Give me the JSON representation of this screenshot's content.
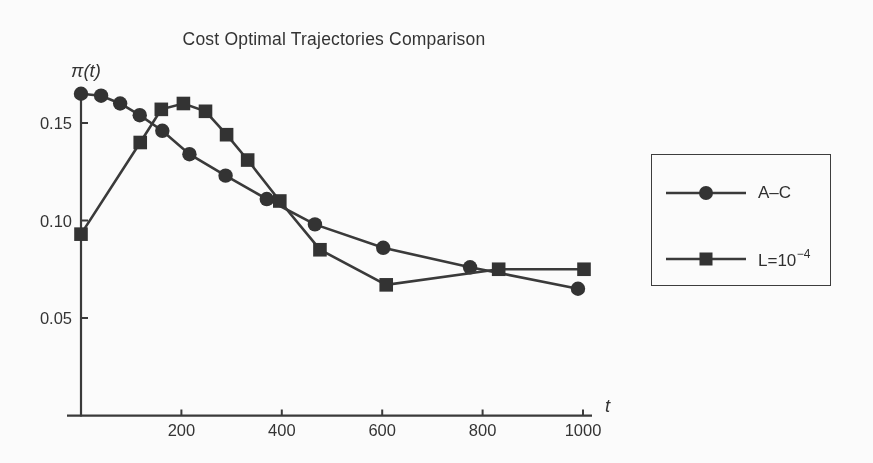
{
  "figure": {
    "background": "#fbfbfb",
    "ink": "#3a3a3a",
    "marker_fill": "#333333"
  },
  "chart_data": {
    "type": "line",
    "title": "Cost Optimal Trajectories Comparison",
    "xlabel": "t",
    "ylabel": "π(t)",
    "xlim": [
      0,
      1040
    ],
    "ylim": [
      0,
      0.17
    ],
    "grid": false,
    "legend_position": "outside-right",
    "x_ticks": [
      {
        "value": 200,
        "label": "200"
      },
      {
        "value": 400,
        "label": "400"
      },
      {
        "value": 600,
        "label": "600"
      },
      {
        "value": 800,
        "label": "800"
      },
      {
        "value": 1000,
        "label": "1000"
      }
    ],
    "y_ticks": [
      {
        "value": 0.05,
        "label": "0.05"
      },
      {
        "value": 0.1,
        "label": "0.10"
      },
      {
        "value": 0.15,
        "label": "0.15"
      }
    ],
    "series": [
      {
        "name": "A–C",
        "marker": "circle",
        "x": [
          0,
          40,
          78,
          117,
          162,
          216,
          288,
          370,
          466,
          602,
          775,
          990
        ],
        "y": [
          0.165,
          0.164,
          0.16,
          0.154,
          0.146,
          0.134,
          0.123,
          0.111,
          0.098,
          0.086,
          0.076,
          0.065
        ]
      },
      {
        "name": "L=10⁻⁴",
        "marker": "square",
        "x": [
          0,
          118,
          160,
          204,
          248,
          290,
          332,
          396,
          476,
          608,
          832,
          1002
        ],
        "y": [
          0.093,
          0.14,
          0.157,
          0.16,
          0.156,
          0.144,
          0.131,
          0.11,
          0.085,
          0.067,
          0.075,
          0.075
        ]
      }
    ]
  },
  "legend": {
    "items": [
      {
        "marker": "circle",
        "base": "A–C",
        "sup": ""
      },
      {
        "marker": "square",
        "base": "L=10",
        "sup": "−4"
      }
    ]
  }
}
